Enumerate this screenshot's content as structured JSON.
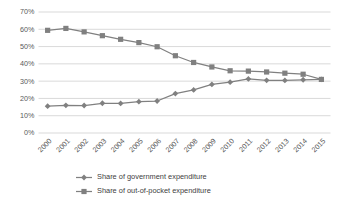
{
  "chart_data": {
    "type": "line",
    "title": "",
    "subtitle": "",
    "xlabel": "",
    "ylabel": "",
    "categories": [
      "2000",
      "2001",
      "2002",
      "2003",
      "2004",
      "2005",
      "2006",
      "2007",
      "2008",
      "2009",
      "2010",
      "2011",
      "2012",
      "2013",
      "2014",
      "2015"
    ],
    "ylim": [
      0,
      70
    ],
    "ytick_labels": [
      "0%",
      "10%",
      "20%",
      "30%",
      "40%",
      "50%",
      "60%",
      "70%"
    ],
    "ytick_values": [
      0,
      10,
      20,
      30,
      40,
      50,
      60,
      70
    ],
    "grid": true,
    "legend_position": "bottom",
    "series": [
      {
        "name": "Share of government expenditure",
        "marker": "diamond",
        "color": "#808080",
        "values": [
          15.5,
          16.0,
          15.9,
          17.2,
          17.1,
          18.1,
          18.5,
          22.8,
          24.9,
          28.1,
          29.4,
          31.3,
          30.5,
          30.4,
          30.8,
          31.0
        ]
      },
      {
        "name": "Share of out-of-pocket expenditure",
        "marker": "square",
        "color": "#808080",
        "values": [
          59.4,
          60.5,
          58.5,
          56.3,
          54.2,
          52.3,
          49.9,
          44.7,
          40.8,
          38.2,
          36.0,
          35.8,
          35.3,
          34.6,
          34.0,
          31.0
        ]
      }
    ]
  },
  "legend": {
    "items": [
      {
        "label": "Share of government expenditure",
        "marker": "diamond"
      },
      {
        "label": "Share of out-of-pocket expenditure",
        "marker": "square"
      }
    ]
  },
  "colors": {
    "series": "#808080",
    "gridline": "#c8c8c8",
    "text": "#595959",
    "background": "#ffffff"
  }
}
